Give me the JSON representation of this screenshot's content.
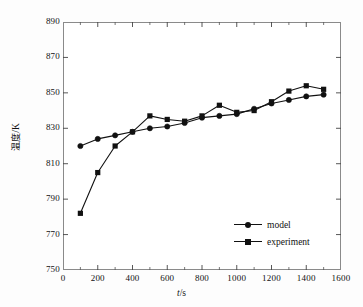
{
  "chart_data": {
    "type": "line",
    "title": "",
    "xlabel": "t/s",
    "xlabel_var": "t",
    "xlabel_unit": "/s",
    "ylabel": "温度/K",
    "ylabel_cjk": "温度",
    "ylabel_unit": "/K",
    "xlim": [
      0,
      1600
    ],
    "ylim": [
      750,
      890
    ],
    "xticks": [
      0,
      200,
      400,
      600,
      800,
      1000,
      1200,
      1400,
      1600
    ],
    "yticks": [
      750,
      770,
      790,
      810,
      830,
      850,
      870,
      890
    ],
    "x_minor_interval": 100,
    "grid": false,
    "legend_position": "lower-right",
    "x": [
      100,
      200,
      300,
      400,
      500,
      600,
      700,
      800,
      900,
      1000,
      1100,
      1200,
      1300,
      1400,
      1500
    ],
    "series": [
      {
        "name": "model",
        "marker": "circle",
        "color": "#111111",
        "values": [
          820,
          824,
          826,
          828,
          830,
          831,
          833,
          836,
          837,
          838,
          841,
          844,
          846,
          848,
          849
        ]
      },
      {
        "name": "experiment",
        "marker": "square",
        "color": "#111111",
        "values": [
          782,
          805,
          820,
          828,
          837,
          835,
          834,
          837,
          843,
          839,
          840,
          845,
          851,
          854,
          852
        ]
      }
    ]
  },
  "legend": {
    "items": [
      {
        "label": "model",
        "marker": "circle"
      },
      {
        "label": "experiment",
        "marker": "square"
      }
    ]
  }
}
